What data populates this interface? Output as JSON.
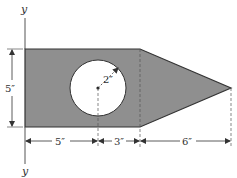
{
  "figure": {
    "axis_label_top": "y",
    "axis_label_bottom": "y",
    "dimensions": {
      "height_left": "5″",
      "bottom_segment_1": "5″",
      "bottom_segment_2": "3″",
      "bottom_segment_3": "6″",
      "hole_radius": "2″"
    },
    "colors": {
      "fill": "#8f8f8f",
      "stroke": "#333333",
      "hole": "#ffffff"
    }
  }
}
